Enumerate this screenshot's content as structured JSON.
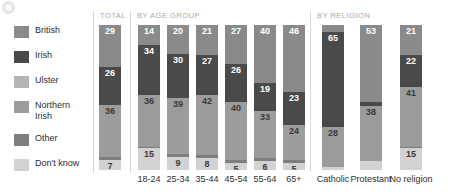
{
  "icon": "info-circle-icon",
  "legend": {
    "items": [
      {
        "label": "British",
        "color": "#8a8a8a"
      },
      {
        "label": "Irish",
        "color": "#4a4a4a"
      },
      {
        "label": "Ulster",
        "color": "#b4b4b4"
      },
      {
        "label": "Northern\nIrish",
        "color": "#9c9c9c"
      },
      {
        "label": "Other",
        "color": "#7e7e7e"
      },
      {
        "label": "Don't know",
        "color": "#d2d2d2"
      }
    ]
  },
  "group_headers": [
    {
      "label": "TOTAL"
    },
    {
      "label": "BY AGE GROUP"
    },
    {
      "label": "BY RELIGION"
    }
  ],
  "chart_data": {
    "type": "bar",
    "subtype": "stacked-100-percent",
    "title": "",
    "xlabel": "",
    "ylabel": "",
    "ylim": [
      0,
      100
    ],
    "grid": false,
    "legend_position": "left",
    "series": [
      {
        "name": "British",
        "color": "#8a8a8a"
      },
      {
        "name": "Irish",
        "color": "#4a4a4a"
      },
      {
        "name": "Ulster",
        "color": "#b4b4b4"
      },
      {
        "name": "Northern Irish",
        "color": "#9c9c9c"
      },
      {
        "name": "Other",
        "color": "#7e7e7e"
      },
      {
        "name": "Don't know",
        "color": "#d2d2d2"
      }
    ],
    "categories": [
      "TOTAL",
      "18-24",
      "25-34",
      "35-44",
      "45-54",
      "55-64",
      "65+",
      "Catholic",
      "Protestant",
      "No religion"
    ],
    "columns": [
      {
        "key": "total",
        "label": "TOTAL",
        "group": "TOTAL",
        "segments": [
          {
            "name": "British",
            "value": 29,
            "show": true,
            "textcolor": "light"
          },
          {
            "name": "Irish",
            "value": 26,
            "show": true,
            "textcolor": "light"
          },
          {
            "name": "Northern Irish",
            "value": 36,
            "show": true,
            "textcolor": "dark"
          },
          {
            "name": "Other",
            "value": 2,
            "show": false,
            "textcolor": "dark"
          },
          {
            "name": "Don't know",
            "value": 7,
            "show": true,
            "textcolor": "dark"
          }
        ]
      },
      {
        "key": "age_18_24",
        "label": "18-24",
        "group": "BY AGE GROUP",
        "segments": [
          {
            "name": "British",
            "value": 14,
            "show": true,
            "textcolor": "light"
          },
          {
            "name": "Irish",
            "value": 34,
            "show": true,
            "textcolor": "light"
          },
          {
            "name": "Northern Irish",
            "value": 36,
            "show": true,
            "textcolor": "dark"
          },
          {
            "name": "Other",
            "value": 1,
            "show": false,
            "textcolor": "dark"
          },
          {
            "name": "Don't know",
            "value": 15,
            "show": true,
            "textcolor": "dark"
          }
        ]
      },
      {
        "key": "age_25_34",
        "label": "25-34",
        "group": "BY AGE GROUP",
        "segments": [
          {
            "name": "British",
            "value": 20,
            "show": true,
            "textcolor": "light"
          },
          {
            "name": "Irish",
            "value": 30,
            "show": true,
            "textcolor": "light"
          },
          {
            "name": "Northern Irish",
            "value": 39,
            "show": true,
            "textcolor": "dark"
          },
          {
            "name": "Other",
            "value": 2,
            "show": false,
            "textcolor": "dark"
          },
          {
            "name": "Don't know",
            "value": 9,
            "show": true,
            "textcolor": "dark"
          }
        ]
      },
      {
        "key": "age_35_44",
        "label": "35-44",
        "group": "BY AGE GROUP",
        "segments": [
          {
            "name": "British",
            "value": 21,
            "show": true,
            "textcolor": "light"
          },
          {
            "name": "Irish",
            "value": 27,
            "show": true,
            "textcolor": "light"
          },
          {
            "name": "Northern Irish",
            "value": 42,
            "show": true,
            "textcolor": "dark"
          },
          {
            "name": "Other",
            "value": 2,
            "show": false,
            "textcolor": "dark"
          },
          {
            "name": "Don't know",
            "value": 8,
            "show": true,
            "textcolor": "dark"
          }
        ]
      },
      {
        "key": "age_45_54",
        "label": "45-54",
        "group": "BY AGE GROUP",
        "segments": [
          {
            "name": "British",
            "value": 27,
            "show": true,
            "textcolor": "light"
          },
          {
            "name": "Irish",
            "value": 26,
            "show": true,
            "textcolor": "light"
          },
          {
            "name": "Northern Irish",
            "value": 40,
            "show": true,
            "textcolor": "dark"
          },
          {
            "name": "Other",
            "value": 2,
            "show": false,
            "textcolor": "dark"
          },
          {
            "name": "Don't know",
            "value": 5,
            "show": true,
            "textcolor": "dark"
          }
        ]
      },
      {
        "key": "age_55_64",
        "label": "55-64",
        "group": "BY AGE GROUP",
        "segments": [
          {
            "name": "British",
            "value": 40,
            "show": true,
            "textcolor": "light"
          },
          {
            "name": "Irish",
            "value": 19,
            "show": true,
            "textcolor": "light"
          },
          {
            "name": "Northern Irish",
            "value": 33,
            "show": true,
            "textcolor": "dark"
          },
          {
            "name": "Other",
            "value": 2,
            "show": false,
            "textcolor": "dark"
          },
          {
            "name": "Don't know",
            "value": 6,
            "show": true,
            "textcolor": "dark"
          }
        ]
      },
      {
        "key": "age_65_plus",
        "label": "65+",
        "group": "BY AGE GROUP",
        "segments": [
          {
            "name": "British",
            "value": 46,
            "show": true,
            "textcolor": "light"
          },
          {
            "name": "Irish",
            "value": 23,
            "show": true,
            "textcolor": "light"
          },
          {
            "name": "Northern Irish",
            "value": 24,
            "show": true,
            "textcolor": "dark"
          },
          {
            "name": "Other",
            "value": 2,
            "show": false,
            "textcolor": "dark"
          },
          {
            "name": "Don't know",
            "value": 5,
            "show": true,
            "textcolor": "dark"
          }
        ]
      },
      {
        "key": "catholic",
        "label": "Catholic",
        "group": "BY RELIGION",
        "segments": [
          {
            "name": "British",
            "value": 5,
            "show": false,
            "textcolor": "light"
          },
          {
            "name": "Irish",
            "value": 65,
            "show": true,
            "textcolor": "light"
          },
          {
            "name": "Northern Irish",
            "value": 28,
            "show": true,
            "textcolor": "dark"
          },
          {
            "name": "Don't know",
            "value": 2,
            "show": false,
            "textcolor": "dark"
          }
        ]
      },
      {
        "key": "protestant",
        "label": "Protestant",
        "group": "BY RELIGION",
        "segments": [
          {
            "name": "British",
            "value": 53,
            "show": true,
            "textcolor": "light"
          },
          {
            "name": "Irish",
            "value": 3,
            "show": false,
            "textcolor": "light"
          },
          {
            "name": "Northern Irish",
            "value": 38,
            "show": true,
            "textcolor": "dark"
          },
          {
            "name": "Don't know",
            "value": 6,
            "show": false,
            "textcolor": "dark"
          }
        ]
      },
      {
        "key": "no_religion",
        "label": "No religion",
        "group": "BY RELIGION",
        "segments": [
          {
            "name": "British",
            "value": 21,
            "show": true,
            "textcolor": "light"
          },
          {
            "name": "Irish",
            "value": 22,
            "show": true,
            "textcolor": "light"
          },
          {
            "name": "Northern Irish",
            "value": 41,
            "show": true,
            "textcolor": "dark"
          },
          {
            "name": "Other",
            "value": 1,
            "show": false,
            "textcolor": "dark"
          },
          {
            "name": "Don't know",
            "value": 15,
            "show": true,
            "textcolor": "dark"
          }
        ]
      }
    ]
  }
}
